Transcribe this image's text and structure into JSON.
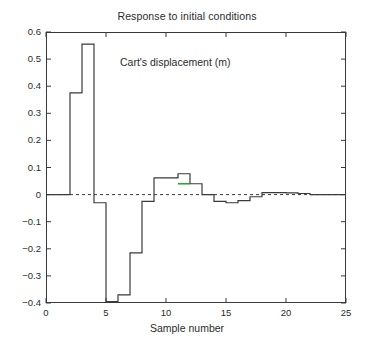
{
  "chart_data": {
    "type": "line",
    "subtype": "stairstep-zero-order-hold",
    "title": "Response to initial conditions",
    "annotation": "Cart's displacement (m)",
    "xlabel": "Sample number",
    "ylabel": "",
    "xlim": [
      0,
      25
    ],
    "ylim": [
      -0.4,
      0.6
    ],
    "xticks": [
      0,
      5,
      10,
      15,
      20,
      25
    ],
    "xtick_labels": [
      "0",
      "5",
      "10",
      "15",
      "20",
      "25"
    ],
    "yticks": [
      -0.4,
      -0.3,
      -0.2,
      -0.1,
      0,
      0.1,
      0.2,
      0.3,
      0.4,
      0.5,
      0.6
    ],
    "ytick_labels": [
      "−0.4",
      "−0.3",
      "−0.2",
      "−0.1",
      "0",
      "0.1",
      "0.2",
      "0.3",
      "0.4",
      "0.5",
      "0.6"
    ],
    "grid": false,
    "legend": false,
    "zero_reference_line": {
      "value": 0,
      "style": "dashed",
      "color": "#3a3a3a"
    },
    "line_color": "#3a3a3a",
    "highlight_color": "#2fa32f",
    "highlight_segment": {
      "x_start": 11,
      "x_end": 12,
      "value": 0.04
    },
    "x": [
      0,
      1,
      2,
      3,
      4,
      5,
      6,
      7,
      8,
      9,
      10,
      11,
      12,
      13,
      14,
      15,
      16,
      17,
      18,
      19,
      20,
      21,
      22,
      23,
      24,
      25
    ],
    "values": [
      0,
      0,
      0.375,
      0.555,
      -0.03,
      -0.395,
      -0.37,
      -0.215,
      -0.025,
      0.062,
      0.062,
      0.077,
      0.04,
      0.0,
      -0.025,
      -0.03,
      -0.022,
      -0.008,
      0.007,
      0.007,
      0.006,
      0.004,
      0,
      0,
      0,
      0
    ],
    "series": [
      {
        "name": "Cart's displacement",
        "values": [
          0,
          0,
          0.375,
          0.555,
          -0.03,
          -0.395,
          -0.37,
          -0.215,
          -0.025,
          0.062,
          0.062,
          0.077,
          0.04,
          0.0,
          -0.025,
          -0.03,
          -0.022,
          -0.008,
          0.007,
          0.007,
          0.006,
          0.004,
          0,
          0,
          0,
          0
        ]
      }
    ]
  }
}
